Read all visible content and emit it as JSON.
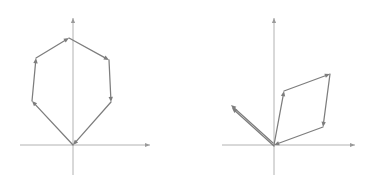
{
  "figure": {
    "background_color": "#ffffff",
    "axis_color": "#b2b2b2",
    "vector_color": "#7d7d7d",
    "width": 368,
    "height": 191
  },
  "panels": [
    {
      "id": "left-panel",
      "name": "closed-hexagon-vector-chain",
      "description": "Six head-to-tail vectors forming a closed hexagonal polygon returning to the origin",
      "origin": {
        "x": 73,
        "y": 145
      },
      "axes": {
        "x": {
          "from": {
            "x": 20,
            "y": 145
          },
          "to": {
            "x": 150,
            "y": 145
          },
          "arrow": "right"
        },
        "y": {
          "from": {
            "x": 73,
            "y": 175
          },
          "to": {
            "x": 73,
            "y": 18
          },
          "arrow": "up"
        }
      },
      "vectors": [
        {
          "name": "v1",
          "from": {
            "x": 73,
            "y": 145
          },
          "to": {
            "x": 32,
            "y": 101
          },
          "arrow": true
        },
        {
          "name": "v2",
          "from": {
            "x": 32,
            "y": 101
          },
          "to": {
            "x": 36,
            "y": 58
          },
          "arrow": true
        },
        {
          "name": "v3",
          "from": {
            "x": 36,
            "y": 58
          },
          "to": {
            "x": 69,
            "y": 38
          },
          "arrow": true
        },
        {
          "name": "v4",
          "from": {
            "x": 69,
            "y": 38
          },
          "to": {
            "x": 109,
            "y": 60
          },
          "arrow": true
        },
        {
          "name": "v5",
          "from": {
            "x": 109,
            "y": 60
          },
          "to": {
            "x": 111,
            "y": 102
          },
          "arrow": true
        },
        {
          "name": "v6",
          "from": {
            "x": 111,
            "y": 102
          },
          "to": {
            "x": 73,
            "y": 145
          },
          "arrow": true
        }
      ]
    },
    {
      "id": "right-panel",
      "name": "parallelogram-vector-chain",
      "description": "A doubled vector pointing up-left plus a four-vector parallelogram chain anchored at the origin",
      "origin": {
        "x": 274,
        "y": 145
      },
      "axes": {
        "x": {
          "from": {
            "x": 222,
            "y": 145
          },
          "to": {
            "x": 355,
            "y": 145
          },
          "arrow": "right"
        },
        "y": {
          "from": {
            "x": 274,
            "y": 175
          },
          "to": {
            "x": 274,
            "y": 18
          },
          "arrow": "up"
        }
      },
      "vectors": [
        {
          "name": "w1-lower",
          "from": {
            "x": 274,
            "y": 146
          },
          "to": {
            "x": 232,
            "y": 108
          },
          "arrow": true
        },
        {
          "name": "w1-upper",
          "from": {
            "x": 273,
            "y": 143
          },
          "to": {
            "x": 231,
            "y": 105
          },
          "arrow": true
        },
        {
          "name": "w2",
          "from": {
            "x": 274,
            "y": 145
          },
          "to": {
            "x": 284,
            "y": 91
          },
          "arrow": true
        },
        {
          "name": "w3",
          "from": {
            "x": 284,
            "y": 91
          },
          "to": {
            "x": 330,
            "y": 74
          },
          "arrow": true
        },
        {
          "name": "w4",
          "from": {
            "x": 330,
            "y": 74
          },
          "to": {
            "x": 323,
            "y": 127
          },
          "arrow": true
        },
        {
          "name": "w5",
          "from": {
            "x": 323,
            "y": 127
          },
          "to": {
            "x": 274,
            "y": 145
          },
          "arrow": true
        }
      ]
    }
  ]
}
